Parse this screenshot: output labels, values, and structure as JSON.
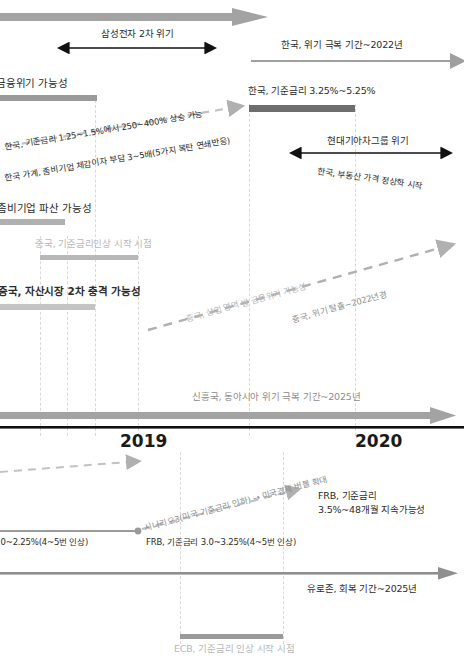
{
  "diagram": {
    "type": "timeline-forecast",
    "years": [
      {
        "label": "2019",
        "x": 128
      },
      {
        "label": "2020",
        "x": 363
      }
    ],
    "axis_note": "central black horizontal axis separating upper (Asia/Korea/China) and lower (US/Euro) panels"
  },
  "upper": {
    "samsung_crisis": "삼성전자 2차 위기",
    "korea_recovery": "한국, 위기 극복 기간~2022년",
    "financial_crisis_possibility": "금융위기 가능성",
    "korea_base_rate_top": "한국, 기준금리 3.25%~5.25%",
    "korea_rate_rise": "한국, 기준금리 1.25~1.5%에서 250~400% 상승 가능",
    "korea_household_burden": "한국 가계, 좀비기업 체감이자 부담 3~5배(5가지 복탄 연쇄반응)",
    "hyundai_kia_crisis": "현대기아차그룹 위기",
    "korea_realestate": "한국, 부동산 가격 정상화 시작",
    "zombie_bankruptcy": "좀비기업 파산 가능성",
    "china_rate_hike_start": "중국, 기준금리인상 시작 시점",
    "china_asset_shock": "중국, 자산시장 2차 충격 가능성",
    "china_commercial_crisis": "중국, 상업 영역 발 금융위기 가능성",
    "china_escape": "중국, 위기 탈출~2022년경",
    "emerging_recovery": "신흥국, 동아시아 위기 극복 기간~2025년"
  },
  "lower": {
    "frb_hike_left": ".0~2.25%(4~5번 인상)",
    "frb_rate_mid": "FRB, 기준금리 3.0~3.25%(4~5번 인상)",
    "scenario3": "시나리오3(미국 기준금리 인하) → 미국경제 버블 확대",
    "frb_sustain_line1": "FRB, 기준금리",
    "frb_sustain_line2": "3.5%~48개월 지속가능성",
    "eurozone_recovery": "유로존, 회복 기간~2025년",
    "ecb_start": "ECB, 기준금리 인상 시작 시점"
  },
  "colors": {
    "bar_dark": "#6e6e6e",
    "bar_mid": "#9a9a9a",
    "bar_light": "#c9c9c9",
    "arrow_grey": "#a0a0a0",
    "arrow_black": "#111111",
    "dashed_grey": "#b9b9b9",
    "gridline": "#d9d9d9",
    "text_dark": "#2b2b2b",
    "text_grey": "#b7b7b7"
  }
}
